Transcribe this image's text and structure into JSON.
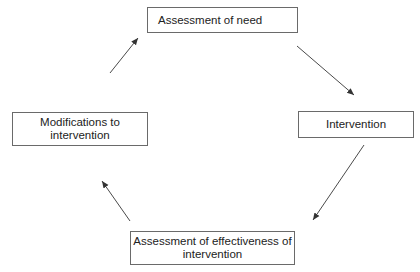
{
  "diagram": {
    "type": "cycle",
    "nodes": [
      {
        "id": "need",
        "label": "Assessment of need"
      },
      {
        "id": "intervention",
        "label": "Intervention"
      },
      {
        "id": "effectiveness",
        "label": "Assessment of effectiveness of intervention",
        "lines": [
          "Assessment of effectiveness of",
          "intervention"
        ]
      },
      {
        "id": "modifications",
        "label": "Modifications to intervention",
        "lines": [
          "Modifications to",
          "intervention"
        ]
      }
    ],
    "edges": [
      {
        "from": "need",
        "to": "intervention"
      },
      {
        "from": "intervention",
        "to": "effectiveness"
      },
      {
        "from": "effectiveness",
        "to": "modifications"
      },
      {
        "from": "modifications",
        "to": "need"
      }
    ],
    "colors": {
      "line": "#4a4a4a",
      "border": "#6a6a6a",
      "text": "#222222"
    }
  }
}
